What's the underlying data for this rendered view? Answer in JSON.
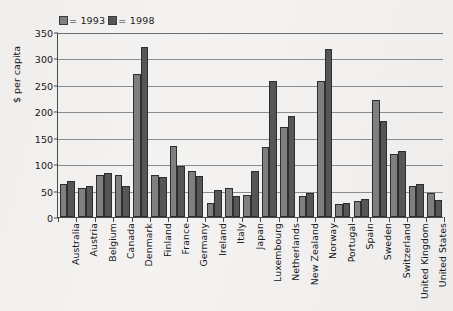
{
  "chart_data": {
    "type": "bar",
    "title": "",
    "xlabel": "",
    "ylabel": "$ per capita",
    "ylim": [
      0,
      350
    ],
    "ytick_step": 50,
    "yticks": [
      "0",
      "50",
      "100",
      "150",
      "200",
      "250",
      "300",
      "350"
    ],
    "grid": true,
    "legend_position": "top-left",
    "categories": [
      "Australia",
      "Austria",
      "Belgium",
      "Canada",
      "Denmark",
      "Finland",
      "France",
      "Germany",
      "Ireland",
      "Italy",
      "Japan",
      "Luxembourg",
      "Netherlands",
      "New Zealand",
      "Norway",
      "Portugal",
      "Spain",
      "Sweden",
      "Switzerland",
      "United Kingdom",
      "United States"
    ],
    "series": [
      {
        "name": "1993",
        "color": "#807f7f",
        "values": [
          62,
          55,
          80,
          80,
          270,
          80,
          135,
          88,
          26,
          55,
          42,
          132,
          170,
          40,
          258,
          24,
          30,
          222,
          120,
          58,
          45
        ]
      },
      {
        "name": "1998",
        "color": "#575656",
        "values": [
          68,
          58,
          83,
          58,
          322,
          76,
          96,
          78,
          52,
          40,
          88,
          258,
          192,
          45,
          318,
          26,
          35,
          182,
          125,
          62,
          32
        ]
      }
    ],
    "legend": [
      {
        "marker_color": "#807f7f",
        "label": "= 1993"
      },
      {
        "marker_color": "#575656",
        "label": "= 1998"
      }
    ]
  }
}
